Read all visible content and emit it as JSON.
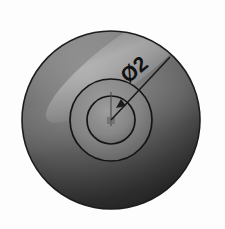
{
  "drawing": {
    "title": "Shaded circular part with diameter dimension",
    "background_color": "#fdfdfd",
    "annotation": {
      "label": "Ø2",
      "symbol_name": "diameter-symbol",
      "value": "2",
      "rotation_deg": -40,
      "text_color": "#111111"
    },
    "geometry": {
      "center": {
        "x": 111,
        "y": 120
      },
      "circles": [
        {
          "name": "outer-disc",
          "radius": 89,
          "fill_top": "#7a7a7a",
          "fill_bottom": "#343434",
          "stroke": "#1d1d1d"
        },
        {
          "name": "middle-ring",
          "radius": 41,
          "fill_top": "#8a8a8a",
          "fill_bottom": "#565656",
          "stroke": "#141414"
        },
        {
          "name": "inner-circle",
          "radius": 24,
          "fill_top": "#8f8f8f",
          "fill_bottom": "#5e5e5e",
          "stroke": "#141414"
        }
      ],
      "highlight": {
        "name": "specular-highlight",
        "color": "#a9a9a9"
      },
      "leader_line": {
        "x1": 111,
        "y1": 120,
        "x2": 170,
        "y2": 57,
        "color": "#1a1a1a"
      },
      "arrowhead": {
        "x": 121,
        "y": 99,
        "color": "#1a1a1a"
      },
      "centerline_vertical": {
        "x": 111,
        "y1": 92,
        "y2": 126,
        "color": "#4a4a4a"
      },
      "center_mark": {
        "x": 111,
        "y": 120,
        "color": "#4a4a4a"
      }
    },
    "colors": {
      "line": "#1a1a1a",
      "paper": "#fdfdfd"
    }
  }
}
